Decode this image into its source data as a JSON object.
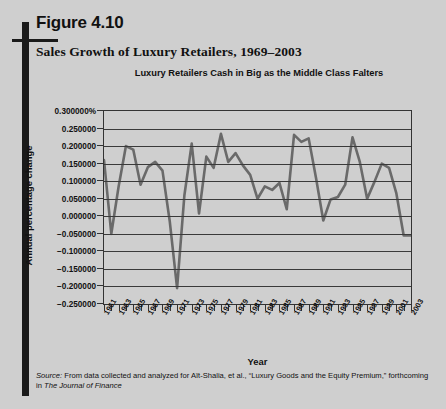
{
  "figure": {
    "label": "Figure 4.10",
    "title": "Sales Growth of Luxury Retailers, 1969–2003"
  },
  "source": {
    "prefix": "Source:",
    "text": " From data collected and analyzed for Aït-Shalia, et al., “Luxury Goods and the Equity Premium,” forthcoming in ",
    "journal": "The Journal of Finance"
  },
  "style": {
    "background": "#cfcfcf",
    "ink": "#111111",
    "line_color": "#6a6a6a",
    "grid_color": "#3a3a3a",
    "spine_color": "#1a1a1a"
  },
  "chart_data": {
    "type": "line",
    "title": "Luxury Retailers Cash in Big as the Middle Class Falters",
    "xlabel": "Year",
    "ylabel": "Annual percentage change",
    "grid": true,
    "legend": "none",
    "ylim": [
      -0.25,
      0.3
    ],
    "xlim": [
      1961,
      2003
    ],
    "ytick_labels": [
      "0.300000%",
      "0.250000",
      "0.200000",
      "0.150000",
      "0.100000",
      "0.050000",
      "0.000000",
      "−0.050000",
      "−0.100000",
      "−0.150000",
      "−0.200000",
      "−0.250000"
    ],
    "ytick_values": [
      0.3,
      0.25,
      0.2,
      0.15,
      0.1,
      0.05,
      0.0,
      -0.05,
      -0.1,
      -0.15,
      -0.2,
      -0.25
    ],
    "xtick_labels": [
      "1961",
      "1963",
      "1965",
      "1967",
      "1969",
      "1971",
      "1973",
      "1975",
      "1977",
      "1979",
      "1981",
      "1983",
      "1985",
      "1987",
      "1989",
      "1991",
      "1993",
      "1995",
      "1997",
      "1999",
      "2001",
      "2003"
    ],
    "x": [
      1961,
      1962,
      1963,
      1964,
      1965,
      1966,
      1967,
      1968,
      1969,
      1970,
      1971,
      1972,
      1973,
      1974,
      1975,
      1976,
      1977,
      1978,
      1979,
      1980,
      1981,
      1982,
      1983,
      1984,
      1985,
      1986,
      1987,
      1988,
      1989,
      1990,
      1991,
      1992,
      1993,
      1994,
      1995,
      1996,
      1997,
      1998,
      1999,
      2000,
      2001,
      2002,
      2003
    ],
    "values": [
      0.16,
      -0.05,
      0.085,
      0.2,
      0.19,
      0.09,
      0.14,
      0.155,
      0.13,
      -0.015,
      -0.205,
      0.06,
      0.207,
      0.008,
      0.17,
      0.138,
      0.235,
      0.155,
      0.18,
      0.145,
      0.118,
      0.05,
      0.085,
      0.075,
      0.095,
      0.02,
      0.232,
      0.212,
      0.222,
      0.11,
      -0.012,
      0.048,
      0.055,
      0.09,
      0.225,
      0.155,
      0.05,
      0.098,
      0.15,
      0.138,
      0.065,
      -0.055,
      -0.055
    ]
  }
}
